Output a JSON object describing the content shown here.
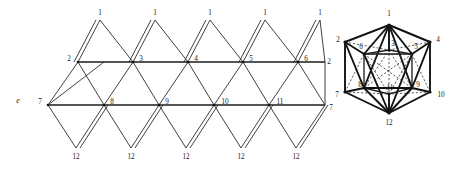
{
  "figure": {
    "title_label": "e",
    "colors": {
      "line": "#2b2b2b",
      "line_bold": "#111111",
      "label": "#1a1a1a",
      "background": "#ffffff"
    }
  },
  "net": {
    "name": "icosahedron-net",
    "top_labels": [
      {
        "text": "1",
        "x": 100,
        "y": 13
      },
      {
        "text": "1",
        "x": 155,
        "y": 13
      },
      {
        "text": "1",
        "x": 210,
        "y": 13
      },
      {
        "text": "1",
        "x": 265,
        "y": 13
      },
      {
        "text": "1",
        "x": 320,
        "y": 13
      }
    ],
    "upper_row_labels": [
      {
        "text": "2",
        "x": 69,
        "y": 59
      },
      {
        "text": "3",
        "x": 141,
        "y": 59
      },
      {
        "text": "4",
        "x": 196,
        "y": 59
      },
      {
        "text": "5",
        "x": 251,
        "y": 59
      },
      {
        "text": "6",
        "x": 306,
        "y": 59
      },
      {
        "text": "2",
        "x": 325,
        "y": 62
      }
    ],
    "lower_row_labels": [
      {
        "text": "7",
        "x": 40,
        "y": 102
      },
      {
        "text": "8",
        "x": 112,
        "y": 102
      },
      {
        "text": "9",
        "x": 167,
        "y": 102
      },
      {
        "text": "10",
        "x": 224,
        "y": 102
      },
      {
        "text": "11",
        "x": 279,
        "y": 102
      },
      {
        "text": "7",
        "x": 325,
        "y": 105
      }
    ],
    "bottom_labels": [
      {
        "text": "12",
        "x": 76,
        "y": 157
      },
      {
        "text": "12",
        "x": 131,
        "y": 157
      },
      {
        "text": "12",
        "x": 186,
        "y": 157
      },
      {
        "text": "12",
        "x": 241,
        "y": 157
      },
      {
        "text": "12",
        "x": 296,
        "y": 157
      }
    ],
    "upper_row_nodes": [
      {
        "id": "2",
        "x": 78,
        "y": 62
      },
      {
        "id": "3",
        "x": 133,
        "y": 62
      },
      {
        "id": "4",
        "x": 188,
        "y": 62
      },
      {
        "id": "5",
        "x": 243,
        "y": 62
      },
      {
        "id": "6",
        "x": 298,
        "y": 62
      }
    ],
    "lower_row_nodes": [
      {
        "id": "7",
        "x": 48,
        "y": 105
      },
      {
        "id": "8",
        "x": 104,
        "y": 105
      },
      {
        "id": "9",
        "x": 159,
        "y": 105
      },
      {
        "id": "10",
        "x": 214,
        "y": 105
      },
      {
        "id": "11",
        "x": 269,
        "y": 105
      }
    ],
    "apex_nodes": [
      {
        "id": "1",
        "x": 100,
        "y": 20
      },
      {
        "id": "1",
        "x": 155,
        "y": 20
      },
      {
        "id": "1",
        "x": 210,
        "y": 20
      },
      {
        "id": "1",
        "x": 265,
        "y": 20
      },
      {
        "id": "1",
        "x": 320,
        "y": 20
      }
    ],
    "bottom_nodes": [
      {
        "id": "12",
        "x": 76,
        "y": 148
      },
      {
        "id": "12",
        "x": 131,
        "y": 148
      },
      {
        "id": "12",
        "x": 186,
        "y": 148
      },
      {
        "id": "12",
        "x": 241,
        "y": 148
      },
      {
        "id": "12",
        "x": 296,
        "y": 148
      }
    ]
  },
  "graph": {
    "name": "icosahedron-graph",
    "outer_labels": [
      {
        "text": "1",
        "x": 389,
        "y": 14
      },
      {
        "text": "2",
        "x": 338,
        "y": 40
      },
      {
        "text": "4",
        "x": 438,
        "y": 40
      },
      {
        "text": "7",
        "x": 337,
        "y": 95
      },
      {
        "text": "10",
        "x": 440,
        "y": 95
      },
      {
        "text": "12",
        "x": 389,
        "y": 123
      }
    ],
    "inner_labels": [
      {
        "text": "6",
        "x": 361,
        "y": 48
      },
      {
        "text": "3",
        "x": 392,
        "y": 44
      },
      {
        "text": "5",
        "x": 415,
        "y": 48
      },
      {
        "text": "8",
        "x": 361,
        "y": 85
      },
      {
        "text": "11",
        "x": 390,
        "y": 89
      },
      {
        "text": "9",
        "x": 417,
        "y": 85
      }
    ],
    "outer_nodes": [
      {
        "id": "1",
        "x": 389,
        "y": 25
      },
      {
        "id": "2",
        "x": 345,
        "y": 42
      },
      {
        "id": "4",
        "x": 430,
        "y": 42
      },
      {
        "id": "7",
        "x": 345,
        "y": 92
      },
      {
        "id": "10",
        "x": 430,
        "y": 92
      },
      {
        "id": "12",
        "x": 389,
        "y": 113
      }
    ],
    "inner_nodes": [
      {
        "id": "6",
        "x": 364,
        "y": 54
      },
      {
        "id": "3",
        "x": 389,
        "y": 50
      },
      {
        "id": "5",
        "x": 412,
        "y": 54
      },
      {
        "id": "8",
        "x": 364,
        "y": 88
      },
      {
        "id": "11",
        "x": 389,
        "y": 94
      },
      {
        "id": "9",
        "x": 412,
        "y": 88
      }
    ]
  }
}
